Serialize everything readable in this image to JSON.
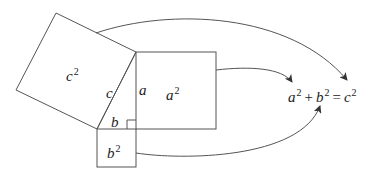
{
  "diagram": {
    "type": "pythagorean-theorem-illustration",
    "squares": [
      {
        "id": "c-square",
        "label_base": "c",
        "label_exp": "2"
      },
      {
        "id": "a-square",
        "label_base": "a",
        "label_exp": "2"
      },
      {
        "id": "b-square",
        "label_base": "b",
        "label_exp": "2"
      }
    ],
    "triangle": {
      "sides": {
        "hypotenuse": "c",
        "vertical_leg": "a",
        "horizontal_leg": "b"
      },
      "right_angle_marker": true
    },
    "equation": {
      "a": "a",
      "a_exp": "2",
      "plus": "+",
      "b": "b",
      "b_exp": "2",
      "equals": "=",
      "c": "c",
      "c_exp": "2"
    },
    "arrows": [
      {
        "from": "c-square",
        "to": "equation-c2"
      },
      {
        "from": "a-square",
        "to": "equation-a2"
      },
      {
        "from": "b-square",
        "to": "equation-b2"
      }
    ],
    "colors": {
      "stroke": "#555555",
      "text": "#222222",
      "background": "#ffffff"
    }
  }
}
